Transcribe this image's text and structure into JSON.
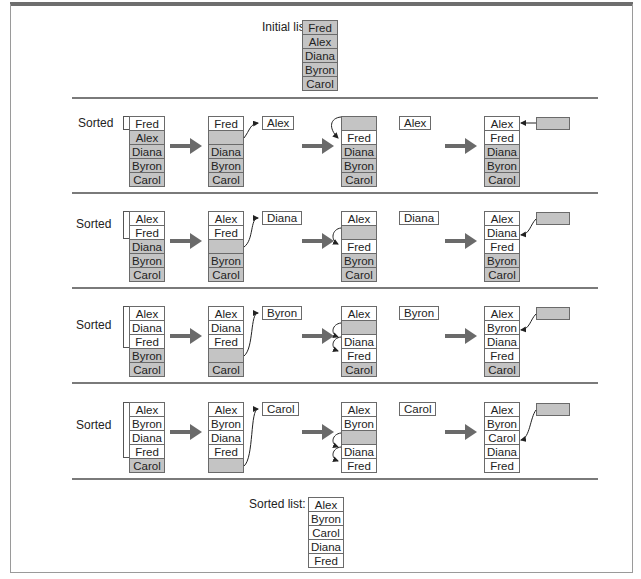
{
  "initial": {
    "label": "Initial list:",
    "items": [
      "Fred",
      "Alex",
      "Diana",
      "Byron",
      "Carol"
    ]
  },
  "sorted_label": "Sorted",
  "rows": [
    {
      "stage1": [
        "Fred",
        "Alex",
        "Diana",
        "Byron",
        "Carol"
      ],
      "stage2": [
        "Fred",
        "",
        "Diana",
        "Byron",
        "Carol"
      ],
      "pivot": "Alex",
      "stage3": [
        "",
        "Fred",
        "Diana",
        "Byron",
        "Carol"
      ],
      "stage4": [
        "Alex",
        "Fred",
        "Diana",
        "Byron",
        "Carol"
      ]
    },
    {
      "stage1": [
        "Alex",
        "Fred",
        "Diana",
        "Byron",
        "Carol"
      ],
      "stage2": [
        "Alex",
        "Fred",
        "",
        "Byron",
        "Carol"
      ],
      "pivot": "Diana",
      "stage3": [
        "Alex",
        "",
        "Fred",
        "Byron",
        "Carol"
      ],
      "stage4": [
        "Alex",
        "Diana",
        "Fred",
        "Byron",
        "Carol"
      ]
    },
    {
      "stage1": [
        "Alex",
        "Diana",
        "Fred",
        "Byron",
        "Carol"
      ],
      "stage2": [
        "Alex",
        "Diana",
        "Fred",
        "",
        "Carol"
      ],
      "pivot": "Byron",
      "stage3": [
        "Alex",
        "",
        "Diana",
        "Fred",
        "Carol"
      ],
      "stage4": [
        "Alex",
        "Byron",
        "Diana",
        "Fred",
        "Carol"
      ]
    },
    {
      "stage1": [
        "Alex",
        "Byron",
        "Diana",
        "Fred",
        "Carol"
      ],
      "stage2": [
        "Alex",
        "Byron",
        "Diana",
        "Fred",
        ""
      ],
      "pivot": "Carol",
      "stage3": [
        "Alex",
        "Byron",
        "",
        "Diana",
        "Fred"
      ],
      "stage4": [
        "Alex",
        "Byron",
        "Carol",
        "Diana",
        "Fred"
      ]
    }
  ],
  "final": {
    "label": "Sorted list:",
    "items": [
      "Alex",
      "Byron",
      "Carol",
      "Diana",
      "Fred"
    ]
  }
}
